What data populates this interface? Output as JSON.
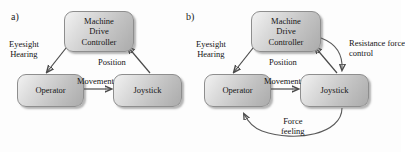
{
  "figure": {
    "background_color": "#fdfdfd",
    "node_fill_light": "#f2f2f2",
    "node_fill_dark": "#ababab",
    "arrow_color": "#4a4a4a",
    "text_color": "#141414"
  },
  "panels": [
    {
      "id": "a",
      "label": "a)",
      "nodes": {
        "controller": {
          "line1": "Machine",
          "line2": "Drive",
          "line3": "Controller"
        },
        "operator": {
          "label": "Operator"
        },
        "joystick": {
          "label": "Joystick"
        }
      },
      "edges": [
        {
          "name": "controller-to-operator",
          "line1": "Eyesight",
          "line2": "Hearing"
        },
        {
          "name": "joystick-to-controller",
          "line1": "Position"
        },
        {
          "name": "operator-to-joystick",
          "line1": "Movement"
        }
      ]
    },
    {
      "id": "b",
      "label": "b)",
      "nodes": {
        "controller": {
          "line1": "Machine",
          "line2": "Drive",
          "line3": "Controller"
        },
        "operator": {
          "label": "Operator"
        },
        "joystick": {
          "label": "Joystick"
        }
      },
      "edges": [
        {
          "name": "controller-to-operator",
          "line1": "Eyesight",
          "line2": "Hearing"
        },
        {
          "name": "joystick-to-controller",
          "line1": "Position"
        },
        {
          "name": "operator-to-joystick",
          "line1": "Movement"
        },
        {
          "name": "controller-to-joystick",
          "line1": "Resistance force",
          "line2": "control"
        },
        {
          "name": "joystick-to-operator",
          "line1": "Force",
          "line2": "feeling"
        }
      ]
    }
  ]
}
